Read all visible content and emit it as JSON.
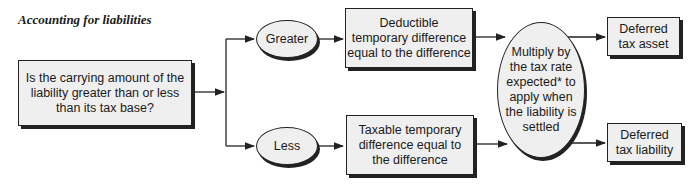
{
  "title": "Accounting for liabilities",
  "nodes": {
    "question": "Is the carrying amount of the\nliability greater than or less\nthan its tax base?",
    "greater": "Greater",
    "less": "Less",
    "deductible": "Deductible\ntemporary difference\nequal to the difference",
    "taxable": "Taxable temporary\ndifference equal to\nthe difference",
    "multiply": "Multiply by\nthe tax rate\nexpected* to\napply when\nthe liability is\nsettled",
    "asset": "Deferred\ntax asset",
    "liability": "Deferred\ntax liability"
  },
  "colors": {
    "fill": "#efefef",
    "stroke": "#222222"
  }
}
